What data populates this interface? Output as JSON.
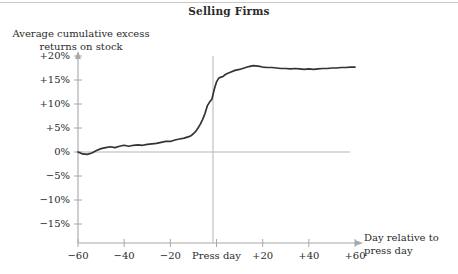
{
  "figure": {
    "title": "Selling Firms",
    "y_axis_label_line1": "Average cumulative excess",
    "y_axis_label_line2": "returns on stock",
    "x_axis_label_line1": "Day relative to",
    "x_axis_label_line2": "press day",
    "press_day_label": "Press day",
    "line_color": "#333333",
    "axis_color": "#a8a8a8",
    "text_color": "#2b2b2b"
  },
  "chart_data": {
    "type": "line",
    "title": "Selling Firms",
    "xlabel": "Day relative to press day",
    "ylabel": "Average cumulative excess returns on stock",
    "xlim": [
      -60,
      60
    ],
    "ylim": [
      -17.5,
      21
    ],
    "grid": false,
    "legend": null,
    "x_ticks": [
      -60,
      -40,
      -20,
      0,
      20,
      40,
      60
    ],
    "x_tick_labels": [
      "−60",
      "−40",
      "−20",
      "Press day",
      "+20",
      "+40",
      "+60"
    ],
    "y_ticks": [
      20,
      15,
      10,
      5,
      0,
      -5,
      -10,
      -15
    ],
    "y_tick_labels": [
      "+20%",
      "+15%",
      "+10%",
      "+5%",
      "0%",
      "−5%",
      "−10%",
      "−15%"
    ],
    "annotations": [
      {
        "type": "vline",
        "x": 0,
        "label": "Press day"
      },
      {
        "type": "hline",
        "y": 0
      }
    ],
    "series": [
      {
        "name": "Selling firms cumulative excess return",
        "x": [
          -60,
          -58,
          -56,
          -54,
          -52,
          -50,
          -48,
          -46,
          -44,
          -42,
          -40,
          -38,
          -36,
          -34,
          -32,
          -30,
          -28,
          -26,
          -24,
          -22,
          -20,
          -18,
          -16,
          -14,
          -12,
          -11,
          -10,
          -9,
          -8,
          -7,
          -6,
          -5,
          -4,
          -3,
          -2,
          -1,
          0,
          1,
          2,
          3,
          4,
          5,
          6,
          8,
          10,
          12,
          14,
          16,
          18,
          20,
          22,
          24,
          26,
          28,
          30,
          32,
          34,
          36,
          38,
          40,
          42,
          44,
          46,
          48,
          50,
          52,
          54,
          56,
          58,
          60
        ],
        "y": [
          0.0,
          -0.4,
          -0.5,
          -0.2,
          0.3,
          0.7,
          0.9,
          1.1,
          0.9,
          1.2,
          1.4,
          1.2,
          1.4,
          1.5,
          1.4,
          1.6,
          1.7,
          1.8,
          2.0,
          2.2,
          2.2,
          2.5,
          2.7,
          2.9,
          3.2,
          3.4,
          3.8,
          4.3,
          5.0,
          5.8,
          6.8,
          8.0,
          9.6,
          10.4,
          11.0,
          13.0,
          14.6,
          15.4,
          15.6,
          15.8,
          16.2,
          16.4,
          16.6,
          17.0,
          17.2,
          17.5,
          17.8,
          18.0,
          17.9,
          17.7,
          17.6,
          17.6,
          17.5,
          17.4,
          17.4,
          17.3,
          17.4,
          17.3,
          17.2,
          17.3,
          17.2,
          17.3,
          17.4,
          17.4,
          17.5,
          17.5,
          17.6,
          17.6,
          17.7,
          17.7
        ]
      }
    ]
  }
}
